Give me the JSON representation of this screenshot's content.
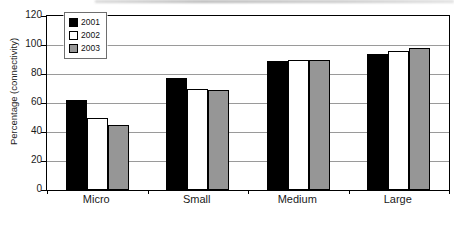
{
  "chart_data": {
    "type": "bar",
    "title": "",
    "categories": [
      "Micro",
      "Small",
      "Medium",
      "Large"
    ],
    "series": [
      {
        "name": "2001",
        "color": "#000000",
        "values": [
          62,
          77,
          89,
          94
        ]
      },
      {
        "name": "2002",
        "color": "#ffffff",
        "values": [
          50,
          70,
          90,
          96
        ]
      },
      {
        "name": "2003",
        "color": "#969696",
        "values": [
          45,
          69,
          90,
          98
        ]
      }
    ],
    "xlabel": "",
    "ylabel": "Percentage (connectivity)",
    "ylim": [
      0,
      120
    ],
    "ytick_step": 20,
    "grid": "horizontal",
    "gridline_color": "#9a9a9a",
    "legend_position": "top-left",
    "bar_outline_color": "#000000"
  }
}
